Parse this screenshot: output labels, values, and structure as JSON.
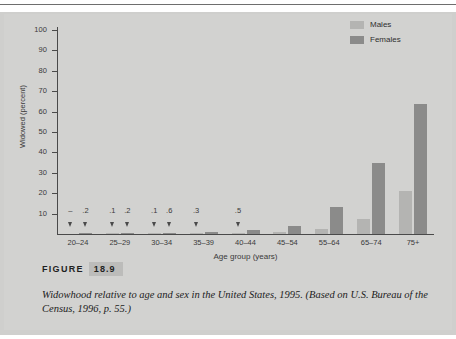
{
  "figure": {
    "label_word": "FIGURE",
    "number": "18.9",
    "caption": "Widowhood relative to age and sex in the United States, 1995. (Based on U.S. Bureau of the Census, 1996, p. 55.)"
  },
  "colors": {
    "males": "#b4b4b2",
    "females": "#8b8b8a",
    "axis": "#4a4a4a",
    "background": "#d2d2d0"
  },
  "chart_data": {
    "type": "bar",
    "title": "",
    "xlabel": "Age group (years)",
    "ylabel": "Widowed (percent)",
    "ylim": [
      0,
      100
    ],
    "yticks": [
      10,
      20,
      30,
      40,
      50,
      60,
      70,
      80,
      90,
      100
    ],
    "grid": false,
    "legend_position": "top-right",
    "categories": [
      "20–24",
      "25–29",
      "30–34",
      "35–39",
      "40–44",
      "45–54",
      "55–64",
      "65–74",
      "75+"
    ],
    "series": [
      {
        "name": "Males",
        "color": "#b4b4b2",
        "values": [
          0,
          0.1,
          0.1,
          0.3,
          0.5,
          0.9,
          2.3,
          7.3,
          21.0
        ],
        "point_labels": [
          "–",
          ".1",
          ".1",
          ".3",
          ".5",
          "",
          "",
          "",
          ""
        ]
      },
      {
        "name": "Females",
        "color": "#8b8b8a",
        "values": [
          0.2,
          0.2,
          0.6,
          0.9,
          1.8,
          3.8,
          13.2,
          35.0,
          63.5
        ],
        "point_labels": [
          ".2",
          ".2",
          ".6",
          "",
          "",
          "",
          "",
          "",
          ""
        ]
      }
    ],
    "annotations": [
      {
        "text": "–",
        "group": "20–24",
        "series": "Males",
        "marker": "down-arrow"
      },
      {
        "text": ".2",
        "group": "20–24",
        "series": "Females",
        "marker": "down-arrow"
      },
      {
        "text": ".1",
        "group": "25–29",
        "series": "Males",
        "marker": "down-arrow"
      },
      {
        "text": ".2",
        "group": "25–29",
        "series": "Females",
        "marker": "down-arrow"
      },
      {
        "text": ".1",
        "group": "30–34",
        "series": "Males",
        "marker": "down-arrow"
      },
      {
        "text": ".6",
        "group": "30–34",
        "series": "Females",
        "marker": "down-arrow"
      },
      {
        "text": ".3",
        "group": "35–39",
        "series": "Males",
        "marker": "down-arrow"
      },
      {
        "text": ".5",
        "group": "40–44",
        "series": "Males",
        "marker": "down-arrow"
      }
    ]
  }
}
